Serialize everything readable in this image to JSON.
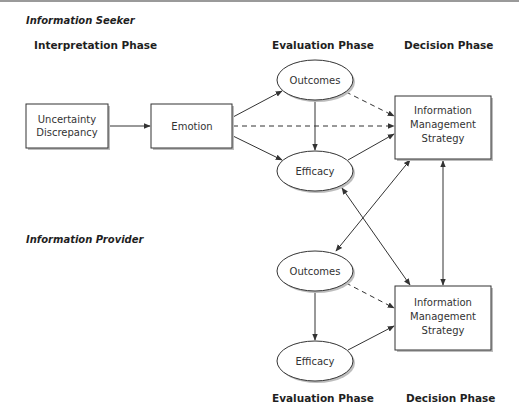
{
  "diagram": {
    "sections": {
      "seeker": {
        "label": "Information Seeker"
      },
      "provider": {
        "label": "Information Provider"
      }
    },
    "phases": {
      "interpretation": "Interpretation Phase",
      "evaluation_top": "Evaluation Phase",
      "decision_top": "Decision Phase",
      "evaluation_bottom": "Evaluation Phase",
      "decision_bottom": "Decision Phase"
    },
    "nodes": {
      "uncertainty": {
        "line1": "Uncertainty",
        "line2": "Discrepancy",
        "shape": "rectangle"
      },
      "emotion": {
        "label": "Emotion",
        "shape": "rectangle"
      },
      "seeker_outcomes": {
        "label": "Outcomes",
        "shape": "ellipse"
      },
      "seeker_efficacy": {
        "label": "Efficacy",
        "shape": "ellipse"
      },
      "seeker_strategy": {
        "line1": "Information",
        "line2": "Management",
        "line3": "Strategy",
        "shape": "rectangle"
      },
      "provider_outcomes": {
        "label": "Outcomes",
        "shape": "ellipse"
      },
      "provider_efficacy": {
        "label": "Efficacy",
        "shape": "ellipse"
      },
      "provider_strategy": {
        "line1": "Information",
        "line2": "Management",
        "line3": "Strategy",
        "shape": "rectangle"
      }
    },
    "edges": [
      {
        "from": "uncertainty",
        "to": "emotion",
        "style": "solid"
      },
      {
        "from": "emotion",
        "to": "seeker_outcomes",
        "style": "solid"
      },
      {
        "from": "emotion",
        "to": "seeker_efficacy",
        "style": "solid"
      },
      {
        "from": "emotion",
        "to": "seeker_strategy",
        "style": "dashed"
      },
      {
        "from": "seeker_outcomes",
        "to": "seeker_efficacy",
        "style": "solid"
      },
      {
        "from": "seeker_outcomes",
        "to": "seeker_strategy",
        "style": "dashed"
      },
      {
        "from": "seeker_efficacy",
        "to": "seeker_strategy",
        "style": "solid"
      },
      {
        "from": "seeker_strategy",
        "to": "provider_outcomes",
        "style": "solid"
      },
      {
        "from": "provider_strategy",
        "to": "seeker_efficacy",
        "style": "solid"
      },
      {
        "from": "seeker_strategy",
        "to": "provider_strategy",
        "style": "solid-bidirectional"
      },
      {
        "from": "provider_outcomes",
        "to": "provider_efficacy",
        "style": "solid"
      },
      {
        "from": "provider_outcomes",
        "to": "provider_strategy",
        "style": "dashed"
      },
      {
        "from": "provider_efficacy",
        "to": "provider_strategy",
        "style": "solid"
      }
    ],
    "colors": {
      "stroke": "#333333",
      "text": "#333333",
      "heading": "#1f1f1f",
      "shadow": "#bdbdbd",
      "background": "#ffffff"
    }
  }
}
